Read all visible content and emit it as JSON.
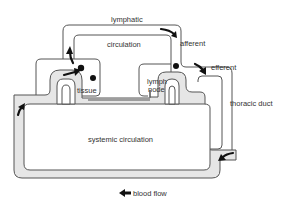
{
  "diagram": {
    "labels": {
      "lymphatic": "lymphatic",
      "circulation": "circulation",
      "afferent": "afferent",
      "efferent": "efferent",
      "tissue": "tissue",
      "lymph_node_line1": "lymph",
      "lymph_node_line2": "node",
      "thoracic_duct": "thoracic duct",
      "systemic_circulation": "systemic circulation",
      "blood_flow": "blood flow"
    },
    "nodes": [
      {
        "id": "tissue",
        "label": "tissue"
      },
      {
        "id": "lymph-node",
        "label": "lymph node"
      },
      {
        "id": "thoracic-duct",
        "label": "thoracic duct"
      }
    ],
    "flows": [
      {
        "from": "tissue",
        "to": "lymphatic",
        "label": "lymphatic"
      },
      {
        "from": "lymphatic",
        "to": "lymph-node",
        "label": "afferent"
      },
      {
        "from": "lymph-node",
        "to": "thoracic-duct",
        "label": "efferent"
      },
      {
        "from": "thoracic-duct",
        "to": "systemic circulation",
        "label": "systemic circulation"
      }
    ],
    "legend": {
      "arrow": "left-arrow",
      "text": "blood flow"
    },
    "colors": {
      "vessel_fill": "#e6e6e6",
      "outline": "#555555",
      "arrow": "#111111"
    }
  }
}
